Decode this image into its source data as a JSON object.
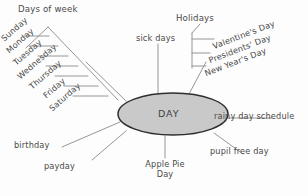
{
  "diagram": {
    "center": {
      "label": "DAY",
      "fill": "#c9c9c9",
      "stroke": "#2e2e2e"
    },
    "line_color": "#8a8a8a",
    "text_color": "#4a4a4a",
    "background": "#fdfdfd"
  },
  "groups": {
    "days_of_week": {
      "heading": "Days of week",
      "items": [
        {
          "label": "Sunday"
        },
        {
          "label": "Monday"
        },
        {
          "label": "Tuesday"
        },
        {
          "label": "Wednesday"
        },
        {
          "label": "Thursday"
        },
        {
          "label": "Friday"
        },
        {
          "label": "Saturday"
        }
      ]
    },
    "holidays": {
      "heading": "Holidays",
      "items": [
        {
          "label": "Valentine's Day"
        },
        {
          "label": "Presidents' Day"
        },
        {
          "label": "New Year's Day"
        }
      ]
    }
  },
  "spokes": [
    {
      "label": "sick days"
    },
    {
      "label": "rainy day schedule"
    },
    {
      "label": "pupil free day"
    },
    {
      "label": "birthday"
    },
    {
      "label": "payday"
    }
  ],
  "apple_pie": {
    "line1": "Apple Pie",
    "line2": "Day"
  }
}
